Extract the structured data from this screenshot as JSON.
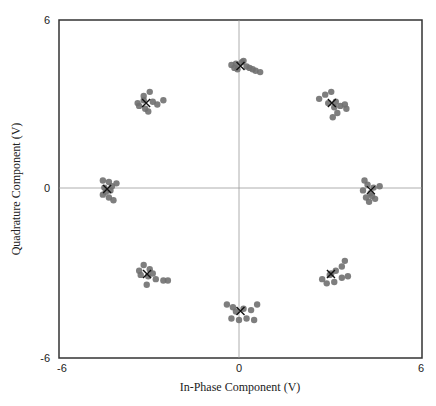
{
  "chart_data": {
    "type": "scatter",
    "title": "",
    "xlabel": "In-Phase Component (V)",
    "ylabel": "Quadrature Component (V)",
    "xlim": [
      -6,
      6
    ],
    "ylim": [
      -6,
      6
    ],
    "xticks": [
      "-6",
      "0",
      "6"
    ],
    "yticks": [
      "6",
      "0",
      "-6"
    ],
    "grid": false,
    "crosshair_at_origin": true,
    "legend": null,
    "series": [
      {
        "name": "received-symbols",
        "marker": "circle",
        "color": "#707070",
        "points": [
          [
            -0.15,
            4.45
          ],
          [
            0.05,
            4.5
          ],
          [
            0.2,
            4.35
          ],
          [
            -0.1,
            4.25
          ],
          [
            0.3,
            4.3
          ],
          [
            0.5,
            4.2
          ],
          [
            0.65,
            4.15
          ],
          [
            -0.3,
            4.4
          ],
          [
            0.1,
            4.55
          ],
          [
            0.4,
            4.25
          ],
          [
            -0.2,
            4.3
          ],
          [
            -3.4,
            3.05
          ],
          [
            -3.2,
            3.3
          ],
          [
            -3.0,
            3.45
          ],
          [
            -2.9,
            3.1
          ],
          [
            -3.15,
            2.85
          ],
          [
            -3.35,
            2.95
          ],
          [
            -2.75,
            3.0
          ],
          [
            -2.55,
            3.15
          ],
          [
            -3.05,
            2.75
          ],
          [
            -3.2,
            3.15
          ],
          [
            2.6,
            3.2
          ],
          [
            2.8,
            3.35
          ],
          [
            3.0,
            3.45
          ],
          [
            3.15,
            3.1
          ],
          [
            3.3,
            2.95
          ],
          [
            3.45,
            3.0
          ],
          [
            3.5,
            2.85
          ],
          [
            3.2,
            2.7
          ],
          [
            3.05,
            2.55
          ],
          [
            2.9,
            3.05
          ],
          [
            3.1,
            2.9
          ],
          [
            -4.55,
            0.3
          ],
          [
            -4.35,
            0.25
          ],
          [
            -4.5,
            0.05
          ],
          [
            -4.3,
            -0.05
          ],
          [
            -4.55,
            -0.2
          ],
          [
            -4.35,
            -0.3
          ],
          [
            -4.2,
            -0.4
          ],
          [
            -4.25,
            0.1
          ],
          [
            -4.45,
            -0.1
          ],
          [
            -4.1,
            0.2
          ],
          [
            4.1,
            0.3
          ],
          [
            4.2,
            0.15
          ],
          [
            4.4,
            0.05
          ],
          [
            4.6,
            0.1
          ],
          [
            4.3,
            -0.15
          ],
          [
            4.15,
            -0.3
          ],
          [
            4.25,
            -0.45
          ],
          [
            4.45,
            -0.35
          ],
          [
            4.05,
            -0.05
          ],
          [
            4.35,
            -0.25
          ],
          [
            -3.2,
            -2.7
          ],
          [
            -3.0,
            -2.85
          ],
          [
            -3.3,
            -3.05
          ],
          [
            -3.05,
            -3.1
          ],
          [
            -2.8,
            -3.2
          ],
          [
            -2.55,
            -3.25
          ],
          [
            -2.4,
            -3.25
          ],
          [
            -3.1,
            -3.4
          ],
          [
            -3.35,
            -2.9
          ],
          [
            -2.9,
            -3.0
          ],
          [
            3.45,
            -2.55
          ],
          [
            3.35,
            -2.75
          ],
          [
            3.15,
            -2.9
          ],
          [
            2.95,
            -3.05
          ],
          [
            2.7,
            -3.2
          ],
          [
            2.85,
            -3.35
          ],
          [
            3.1,
            -3.3
          ],
          [
            3.35,
            -3.15
          ],
          [
            3.55,
            -3.1
          ],
          [
            3.0,
            -3.0
          ],
          [
            -0.45,
            -4.1
          ],
          [
            -0.25,
            -4.2
          ],
          [
            0.1,
            -4.25
          ],
          [
            0.35,
            -4.3
          ],
          [
            0.55,
            -4.1
          ],
          [
            -0.3,
            -4.6
          ],
          [
            -0.05,
            -4.65
          ],
          [
            0.2,
            -4.6
          ],
          [
            0.45,
            -4.65
          ],
          [
            -0.15,
            -4.35
          ]
        ]
      },
      {
        "name": "ideal-constellation",
        "marker": "x",
        "color": "#111111",
        "points": [
          [
            0.0,
            4.37
          ],
          [
            -3.12,
            3.05
          ],
          [
            3.02,
            3.05
          ],
          [
            -4.41,
            0.0
          ],
          [
            4.31,
            -0.04
          ],
          [
            -3.09,
            -3.02
          ],
          [
            2.99,
            -3.02
          ],
          [
            0.0,
            -4.33
          ]
        ]
      }
    ]
  }
}
